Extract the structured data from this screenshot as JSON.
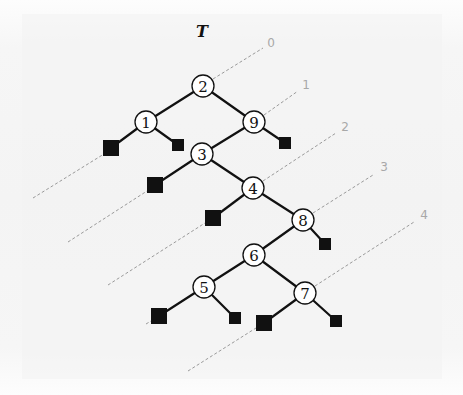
{
  "diagram": {
    "type": "binary-search-tree",
    "root_label": "T",
    "nodes": [
      {
        "id": "n2",
        "key": "2",
        "x": 203,
        "y": 86
      },
      {
        "id": "n1",
        "key": "1",
        "x": 146,
        "y": 122
      },
      {
        "id": "n9",
        "key": "9",
        "x": 254,
        "y": 122
      },
      {
        "id": "n3",
        "key": "3",
        "x": 202,
        "y": 154
      },
      {
        "id": "n4",
        "key": "4",
        "x": 253,
        "y": 188
      },
      {
        "id": "n8",
        "key": "8",
        "x": 303,
        "y": 220
      },
      {
        "id": "n6",
        "key": "6",
        "x": 254,
        "y": 255
      },
      {
        "id": "n5",
        "key": "5",
        "x": 204,
        "y": 287
      },
      {
        "id": "n7",
        "key": "7",
        "x": 305,
        "y": 293
      }
    ],
    "leaves": [
      {
        "id": "l1L",
        "parent": "n1",
        "x": 111,
        "y": 148,
        "size": 16
      },
      {
        "id": "l1R",
        "parent": "n1",
        "x": 178,
        "y": 145,
        "size": 12
      },
      {
        "id": "l9R",
        "parent": "n9",
        "x": 285,
        "y": 143,
        "size": 12
      },
      {
        "id": "l3L",
        "parent": "n3",
        "x": 155,
        "y": 185,
        "size": 16
      },
      {
        "id": "l4L",
        "parent": "n4",
        "x": 213,
        "y": 218,
        "size": 16
      },
      {
        "id": "l8R",
        "parent": "n8",
        "x": 325,
        "y": 244,
        "size": 12
      },
      {
        "id": "l5L",
        "parent": "n5",
        "x": 159,
        "y": 316,
        "size": 16
      },
      {
        "id": "l5R",
        "parent": "n5",
        "x": 235,
        "y": 318,
        "size": 12
      },
      {
        "id": "l7L",
        "parent": "n7",
        "x": 264,
        "y": 323,
        "size": 16
      },
      {
        "id": "l7R",
        "parent": "n7",
        "x": 336,
        "y": 321,
        "size": 12
      }
    ],
    "edges": [
      [
        "n2",
        "n1"
      ],
      [
        "n2",
        "n9"
      ],
      [
        "n1",
        "l1L"
      ],
      [
        "n1",
        "l1R"
      ],
      [
        "n9",
        "n3"
      ],
      [
        "n9",
        "l9R"
      ],
      [
        "n3",
        "l3L"
      ],
      [
        "n3",
        "n4"
      ],
      [
        "n4",
        "l4L"
      ],
      [
        "n4",
        "n8"
      ],
      [
        "n8",
        "n6"
      ],
      [
        "n8",
        "l8R"
      ],
      [
        "n6",
        "n5"
      ],
      [
        "n6",
        "n7"
      ],
      [
        "n5",
        "l5L"
      ],
      [
        "n5",
        "l5R"
      ],
      [
        "n7",
        "l7L"
      ],
      [
        "n7",
        "l7R"
      ]
    ],
    "guide_lines": [
      {
        "label": "0",
        "label_x": 271,
        "label_y": 43,
        "segments": [
          [
            213,
            79,
            263,
            48
          ]
        ]
      },
      {
        "label": "1",
        "label_x": 306,
        "label_y": 85,
        "segments": [
          [
            33,
            198,
            104,
            154
          ],
          [
            264,
            115,
            298,
            91
          ]
        ]
      },
      {
        "label": "2",
        "label_x": 345,
        "label_y": 127,
        "segments": [
          [
            68,
            242,
            147,
            191
          ],
          [
            263,
            181,
            336,
            133
          ]
        ]
      },
      {
        "label": "3",
        "label_x": 384,
        "label_y": 167,
        "segments": [
          [
            108,
            285,
            205,
            223
          ],
          [
            313,
            213,
            373,
            175
          ]
        ]
      },
      {
        "label": "4",
        "label_x": 424,
        "label_y": 215,
        "segments": [
          [
            146,
            324,
            151,
            321
          ],
          [
            188,
            371,
            256,
            328
          ],
          [
            315,
            286,
            414,
            222
          ]
        ]
      }
    ],
    "node_radius": 11
  }
}
